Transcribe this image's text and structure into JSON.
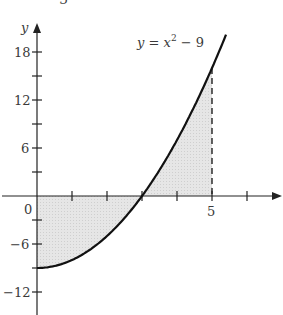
{
  "figure": {
    "equation_label": "y = x² − 9",
    "equation_parts": {
      "y": "y",
      "eq": " = ",
      "x": "x",
      "exp": "2",
      "rest": " − 9"
    },
    "y_axis_label": "y",
    "x_axis_label": "x",
    "origin_label": "0",
    "top_fragment": "3",
    "x_tick_labels": [
      {
        "value": 5,
        "text": "5"
      }
    ],
    "y_tick_labels": [
      {
        "value": 18,
        "text": "18"
      },
      {
        "value": 12,
        "text": "12"
      },
      {
        "value": 6,
        "text": "6"
      },
      {
        "value": -6,
        "text": "−6"
      },
      {
        "value": -12,
        "text": "−12"
      }
    ],
    "x_ticks": [
      1,
      2,
      3,
      4,
      5,
      6
    ],
    "y_ticks": [
      18,
      15,
      12,
      9,
      6,
      3,
      -3,
      -6,
      -9,
      -12
    ],
    "function": "x^2 - 9",
    "shaded_region": {
      "from_x": 0,
      "to_x": 5,
      "description": "area between curve and x-axis from x=0 to x=5"
    },
    "dashed_line_x": 5,
    "colors": {
      "curve": "#111111",
      "shade": "#e2e2e2",
      "axis": "#222222",
      "text": "#3a3a3a"
    }
  }
}
